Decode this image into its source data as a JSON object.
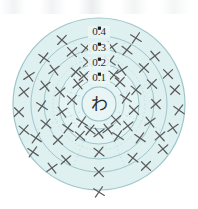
{
  "figure": {
    "center_label": "わ",
    "center_label_name": "center-character-wa",
    "colors": {
      "ring_fill": "#dff0f0",
      "ring_fill_inner": "#e4f3f3",
      "ring_stroke": "#9fc6cc",
      "marker": "#5b5b5b",
      "label_text": "#2b2b2b",
      "spoke": "#b9d8dc",
      "background": "#ffffff"
    },
    "geometry": {
      "center_x": 99,
      "center_y": 104,
      "outer_radius": 86
    }
  },
  "chart_data": {
    "type": "scatter",
    "title": "",
    "subtitle": "",
    "xlabel": "",
    "ylabel": "",
    "grid": true,
    "legend_position": "none",
    "coordinate_system": "polar",
    "radial_axis": {
      "ticks": [
        0.1,
        0.2,
        0.3,
        0.4
      ],
      "tick_labels": [
        "0.1",
        "0.2",
        "0.3",
        "0.4"
      ],
      "tick_label_position": "top",
      "range": [
        0,
        0.45
      ],
      "tick_radii_px": [
        25,
        40,
        55,
        68
      ]
    },
    "rings": [
      {
        "label": "0.1",
        "radius_px": 25,
        "label_x": 99,
        "label_y": 81
      },
      {
        "label": "0.2",
        "radius_px": 40,
        "label_x": 99,
        "label_y": 66
      },
      {
        "label": "0.3",
        "radius_px": 55,
        "label_x": 99,
        "label_y": 51
      },
      {
        "label": "0.4",
        "radius_px": 68,
        "label_x": 99,
        "label_y": 35
      }
    ],
    "center_circle_radius_px": 17,
    "outer_circle_radius_px": 86,
    "spokes_count": 8,
    "marker_symbol": "x",
    "marker_count": 60,
    "points": [
      {
        "x": 99,
        "y": 192
      },
      {
        "x": 99,
        "y": 172
      },
      {
        "x": 99,
        "y": 152
      },
      {
        "x": 99,
        "y": 133
      },
      {
        "x": 80,
        "y": 136
      },
      {
        "x": 118,
        "y": 136
      },
      {
        "x": 66,
        "y": 160
      },
      {
        "x": 133,
        "y": 158
      },
      {
        "x": 52,
        "y": 168
      },
      {
        "x": 146,
        "y": 166
      },
      {
        "x": 33,
        "y": 152
      },
      {
        "x": 163,
        "y": 149
      },
      {
        "x": 24,
        "y": 130
      },
      {
        "x": 173,
        "y": 128
      },
      {
        "x": 19,
        "y": 112
      },
      {
        "x": 179,
        "y": 110
      },
      {
        "x": 24,
        "y": 92
      },
      {
        "x": 175,
        "y": 90
      },
      {
        "x": 29,
        "y": 76
      },
      {
        "x": 168,
        "y": 74
      },
      {
        "x": 44,
        "y": 58
      },
      {
        "x": 155,
        "y": 56
      },
      {
        "x": 62,
        "y": 40
      },
      {
        "x": 136,
        "y": 38
      },
      {
        "x": 72,
        "y": 52
      },
      {
        "x": 127,
        "y": 50
      },
      {
        "x": 45,
        "y": 86
      },
      {
        "x": 152,
        "y": 84
      },
      {
        "x": 42,
        "y": 106
      },
      {
        "x": 156,
        "y": 104
      },
      {
        "x": 46,
        "y": 124
      },
      {
        "x": 150,
        "y": 122
      },
      {
        "x": 58,
        "y": 140
      },
      {
        "x": 140,
        "y": 138
      },
      {
        "x": 60,
        "y": 92
      },
      {
        "x": 136,
        "y": 90
      },
      {
        "x": 62,
        "y": 112
      },
      {
        "x": 134,
        "y": 110
      },
      {
        "x": 68,
        "y": 128
      },
      {
        "x": 128,
        "y": 126
      },
      {
        "x": 76,
        "y": 72
      },
      {
        "x": 122,
        "y": 70
      },
      {
        "x": 88,
        "y": 62
      },
      {
        "x": 110,
        "y": 61
      },
      {
        "x": 78,
        "y": 84
      },
      {
        "x": 120,
        "y": 82
      },
      {
        "x": 82,
        "y": 122
      },
      {
        "x": 116,
        "y": 120
      },
      {
        "x": 90,
        "y": 130
      },
      {
        "x": 108,
        "y": 129
      },
      {
        "x": 72,
        "y": 100
      },
      {
        "x": 126,
        "y": 98
      },
      {
        "x": 84,
        "y": 76
      },
      {
        "x": 114,
        "y": 75
      },
      {
        "x": 54,
        "y": 70
      },
      {
        "x": 144,
        "y": 68
      },
      {
        "x": 36,
        "y": 138
      },
      {
        "x": 160,
        "y": 136
      },
      {
        "x": 86,
        "y": 48
      },
      {
        "x": 112,
        "y": 47
      }
    ]
  }
}
